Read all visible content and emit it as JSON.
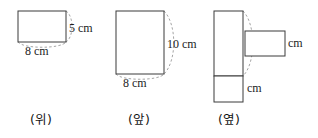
{
  "diagram": {
    "type": "orthographic-views",
    "background_color": "#ffffff",
    "stroke_color": "#3b3b3b",
    "guide_color": "#9a9a9a",
    "unit": "cm",
    "views": [
      {
        "id": "top-view",
        "caption": "(위)",
        "shapes": [
          {
            "id": "top-view-rect",
            "x": 18,
            "y": 11,
            "w": 48,
            "h": 31
          }
        ],
        "arcs": [
          {
            "id": "top-view-right-arc",
            "d": "M 66 11 C 74 16 74 37 66 42"
          },
          {
            "id": "top-view-bottom-arc",
            "d": "M 18 42 C 23 49 61 49 66 42"
          }
        ],
        "labels": [
          {
            "id": "top-view-height-label",
            "text": "5 cm",
            "x": 69,
            "y": 22
          },
          {
            "id": "top-view-width-label",
            "text": "8 cm",
            "x": 25,
            "y": 45
          }
        ]
      },
      {
        "id": "front-view",
        "caption": "(앞)",
        "shapes": [
          {
            "id": "front-view-rect",
            "x": 116,
            "y": 11,
            "w": 48,
            "h": 63
          }
        ],
        "arcs": [
          {
            "id": "front-view-right-arc",
            "d": "M 164 11 C 177 24 177 61 164 74"
          },
          {
            "id": "front-view-bottom-arc",
            "d": "M 116 74 C 121 81 159 81 164 74"
          }
        ],
        "labels": [
          {
            "id": "front-view-height-label",
            "text": "10 cm",
            "x": 167,
            "y": 38
          },
          {
            "id": "front-view-width-label",
            "text": "8 cm",
            "x": 123,
            "y": 77
          }
        ]
      },
      {
        "id": "side-view",
        "caption": "(옆)",
        "shapes": [
          {
            "id": "side-view-main-rect",
            "x": 214,
            "y": 11,
            "w": 29,
            "h": 65
          },
          {
            "id": "side-view-right-rect",
            "x": 245,
            "y": 31,
            "w": 40,
            "h": 25
          },
          {
            "id": "side-view-bottom-rect",
            "x": 214,
            "y": 76,
            "w": 29,
            "h": 26
          }
        ],
        "arcs": [
          {
            "id": "side-view-right-arc",
            "d": "M 243 11 C 256 24 256 63 243 76"
          },
          {
            "id": "side-view-bottom-arc",
            "d": "M 214 76 C 217 82 240 82 243 76"
          }
        ],
        "labels": [
          {
            "id": "side-view-right-unit-label",
            "text": "cm",
            "x": 288,
            "y": 37
          },
          {
            "id": "side-view-bottom-unit-label",
            "text": "cm",
            "x": 247,
            "y": 82
          }
        ]
      }
    ],
    "captions": [
      {
        "id": "caption-top",
        "text": "(위)",
        "x": 30,
        "y": 114
      },
      {
        "id": "caption-front",
        "text": "(앞)",
        "x": 128,
        "y": 114
      },
      {
        "id": "caption-side",
        "text": "(옆)",
        "x": 218,
        "y": 114
      }
    ]
  }
}
